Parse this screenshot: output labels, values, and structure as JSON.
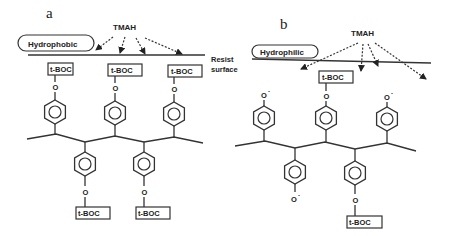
{
  "panels": [
    {
      "id": "a",
      "label": "a",
      "reagent": "TMAH",
      "surface_label": "Hydrophobic",
      "side_label_line1": "Resist",
      "side_label_line2": "surface",
      "top_groups": [
        "t-BOC",
        "t-BOC",
        "t-BOC"
      ],
      "bottom_groups": [
        "t-BOC",
        "t-BOC"
      ],
      "oxygen": "O"
    },
    {
      "id": "b",
      "label": "b",
      "reagent": "TMAH",
      "surface_label": "Hydrophilic",
      "top_groups": [
        "O-",
        "t-BOC",
        "O-"
      ],
      "bottom_groups": [
        "O-",
        "t-BOC"
      ],
      "protecting_group": "t-BOC",
      "oxygen": "O",
      "phenoxide_charge": "-"
    }
  ]
}
